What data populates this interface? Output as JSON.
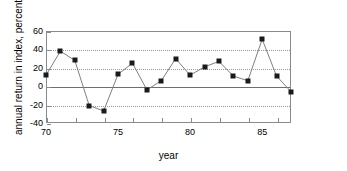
{
  "chart_data": {
    "type": "line",
    "title": "",
    "xlabel": "year",
    "ylabel": "annual return in index, percent",
    "x": [
      70,
      71,
      72,
      73,
      74,
      75,
      76,
      77,
      78,
      79,
      80,
      81,
      82,
      83,
      84,
      85,
      86,
      87
    ],
    "values": [
      12,
      38,
      28,
      -21,
      -27,
      13,
      25,
      -4,
      6,
      30,
      12,
      21,
      27,
      11,
      6,
      51,
      11,
      -6
    ],
    "xlim": [
      70,
      87
    ],
    "ylim": [
      -40,
      60
    ],
    "yticks": [
      60,
      40,
      20,
      0,
      -20,
      -40
    ],
    "ytick_labels": [
      "60",
      "40",
      "20",
      "0",
      "-20",
      "-40"
    ],
    "xticks": [
      70,
      72,
      74,
      76,
      78,
      80,
      82,
      84,
      86
    ],
    "xtick_labels_shown": [
      {
        "value": 70,
        "label": "70"
      },
      {
        "value": 75,
        "label": "75"
      },
      {
        "value": 80,
        "label": "80"
      },
      {
        "value": 85,
        "label": "85"
      }
    ],
    "grid": "horizontal-dotted",
    "gridline_values": [
      40,
      20,
      -20
    ],
    "zero_line": 0,
    "legend": null,
    "marker": "square",
    "marker_color": "#1a1a1a",
    "line_color": "#808080"
  }
}
